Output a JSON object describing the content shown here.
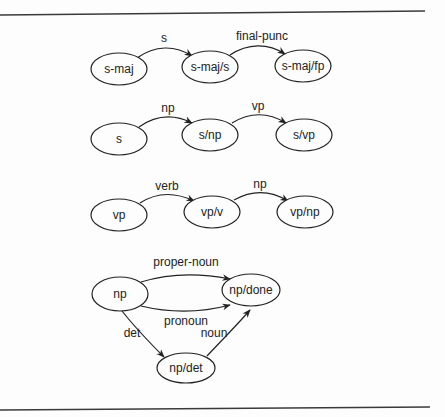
{
  "diagram": {
    "title": "",
    "networks": [
      {
        "id": "s-maj-network",
        "nodes": [
          {
            "id": "s-maj",
            "label": "s-maj"
          },
          {
            "id": "s-maj/s",
            "label": "s-maj/s"
          },
          {
            "id": "s-maj/fp",
            "label": "s-maj/fp"
          }
        ],
        "edges": [
          {
            "from": "s-maj",
            "to": "s-maj/s",
            "label": "s"
          },
          {
            "from": "s-maj/s",
            "to": "s-maj/fp",
            "label": "final-punc"
          }
        ]
      },
      {
        "id": "s-network",
        "nodes": [
          {
            "id": "s",
            "label": "s"
          },
          {
            "id": "s/np",
            "label": "s/np"
          },
          {
            "id": "s/vp",
            "label": "s/vp"
          }
        ],
        "edges": [
          {
            "from": "s",
            "to": "s/np",
            "label": "np"
          },
          {
            "from": "s/np",
            "to": "s/vp",
            "label": "vp"
          }
        ]
      },
      {
        "id": "vp-network",
        "nodes": [
          {
            "id": "vp",
            "label": "vp"
          },
          {
            "id": "vp/v",
            "label": "vp/v"
          },
          {
            "id": "vp/np",
            "label": "vp/np"
          }
        ],
        "edges": [
          {
            "from": "vp",
            "to": "vp/v",
            "label": "verb"
          },
          {
            "from": "vp/v",
            "to": "vp/np",
            "label": "np"
          }
        ]
      },
      {
        "id": "np-network",
        "nodes": [
          {
            "id": "np",
            "label": "np"
          },
          {
            "id": "np/done",
            "label": "np/done"
          },
          {
            "id": "np/det",
            "label": "np/det"
          }
        ],
        "edges": [
          {
            "from": "np",
            "to": "np/done",
            "label": "proper-noun"
          },
          {
            "from": "np",
            "to": "np/done",
            "label": "pronoun"
          },
          {
            "from": "np",
            "to": "np/det",
            "label": "det"
          },
          {
            "from": "np/det",
            "to": "np/done",
            "label": "noun"
          }
        ]
      }
    ]
  }
}
